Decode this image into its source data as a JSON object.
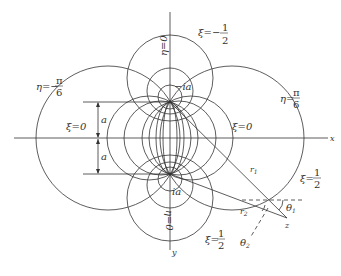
{
  "figure": {
    "type": "bipolar-coordinates",
    "axes": {
      "x_label": "x",
      "y_label": "y"
    },
    "origin_px": [
      170,
      138
    ],
    "a_px": 36,
    "foci": [
      {
        "name": "top-focus",
        "label": "−ia",
        "px": [
          170,
          102
        ]
      },
      {
        "name": "bottom-focus",
        "label": "ia",
        "px": [
          170,
          174
        ]
      }
    ],
    "labels": {
      "xi_minus_half": {
        "lhs": "ξ=−",
        "num": "1",
        "den": "2"
      },
      "xi_half_right": {
        "lhs": "ξ=",
        "num": "1",
        "den": "2"
      },
      "xi_half_bottom": {
        "lhs": "ξ=",
        "num": "1",
        "den": "2"
      },
      "xi_zero_left": "ξ=0",
      "xi_zero_right": "ξ=0",
      "eta_minus_pi6": {
        "lhs": "η=−",
        "num": "π",
        "den": "6"
      },
      "eta_pi6": {
        "lhs": "η=",
        "num": "π",
        "den": "6"
      },
      "eta_zero_top": "η=0",
      "eta_zero_bottom": "η=0",
      "a_upper": "a",
      "a_lower": "a",
      "r1": "r",
      "r1_sub": "1",
      "r2": "r",
      "r2_sub": "2",
      "theta1": "θ",
      "theta1_sub": "1",
      "theta2": "θ",
      "theta2_sub": "2",
      "point_z": "z",
      "minus_ia": "−ia",
      "ia": "ia"
    },
    "xi_circles_top": [
      {
        "cy": 78,
        "r": 43
      },
      {
        "cy": 91,
        "r": 23
      },
      {
        "cy": 97,
        "r": 12
      }
    ],
    "xi_circles_bottom": [
      {
        "cy": 198,
        "r": 43
      },
      {
        "cy": 185,
        "r": 23
      },
      {
        "cy": 179,
        "r": 12
      }
    ],
    "eta_circles": [
      {
        "cx": 232,
        "r": 72
      },
      {
        "cx": 108,
        "r": 72
      },
      {
        "cx": 191,
        "r": 42
      },
      {
        "cx": 149,
        "r": 42
      },
      {
        "cx": 179,
        "r": 37
      },
      {
        "cx": 161,
        "r": 37
      }
    ],
    "point_z_px": [
      287,
      218
    ],
    "colors": {
      "line": "#333333",
      "background": "#ffffff"
    }
  }
}
